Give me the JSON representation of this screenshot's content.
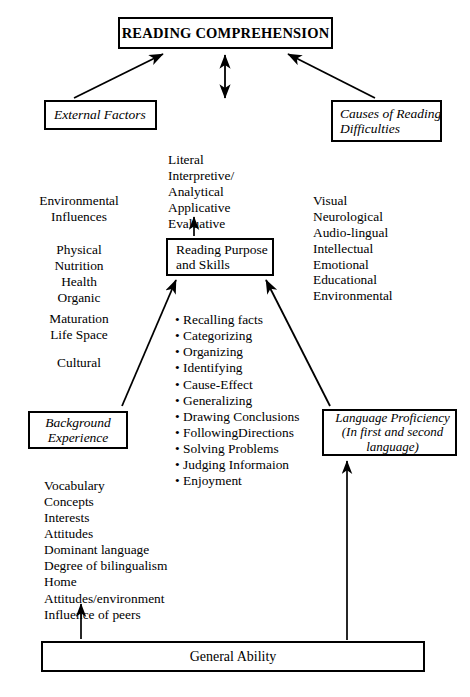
{
  "diagram": {
    "title_box": {
      "label": "READING COMPREHENSION"
    },
    "nodes": {
      "external_factors": {
        "label": "External Factors"
      },
      "causes_of_reading_difficulties": {
        "label": "Causes of Reading\nDifficulties"
      },
      "reading_purpose_and_skills": {
        "label": "Reading Purpose\nand Skills"
      },
      "background_experience": {
        "label": "Background\nExperience"
      },
      "language_proficiency": {
        "label": "Language Proficiency\n(In first and second\nlanguage)"
      },
      "general_ability": {
        "label": "General Ability"
      }
    },
    "lists": {
      "skills_taxonomy": {
        "items": [
          "Literal",
          "Interpretive/",
          "Analytical",
          "Applicative",
          "Evaluative"
        ],
        "text": "Literal\nInterpretive/\nAnalytical\nApplicative\nEvaluative"
      },
      "environmental_influences": {
        "items": [
          "Environmental",
          "Influences"
        ],
        "text": "Environmental\nInfluences"
      },
      "physical": {
        "items": [
          "Physical",
          "Nutrition",
          "Health",
          "Organic"
        ],
        "text": "Physical\nNutrition\nHealth\nOrganic"
      },
      "maturation": {
        "items": [
          "Maturation",
          "Life Space"
        ],
        "text": "Maturation\nLife Space"
      },
      "cultural": {
        "items": [
          "Cultural"
        ],
        "text": "Cultural"
      },
      "causes_factors": {
        "items": [
          "Visual",
          "Neurological",
          "Audio-lingual",
          "Intellectual",
          "Emotional",
          "Educational",
          "Environmental"
        ],
        "text": "Visual\nNeurological\nAudio-lingual\nIntellectual\nEmotional\nEducational\nEnvironmental"
      },
      "comprehension_skills": {
        "items": [
          "• Recalling facts",
          "• Categorizing",
          "• Organizing",
          "• Identifying",
          "• Cause-Effect",
          "• Generalizing",
          "• Drawing Conclusions",
          "• FollowingDirections",
          "• Solving Problems",
          "• Judging Informaion",
          "• Enjoyment"
        ],
        "text": "• Recalling facts\n• Categorizing\n• Organizing\n• Identifying\n• Cause-Effect\n• Generalizing\n• Drawing Conclusions\n• FollowingDirections\n• Solving Problems\n• Judging Informaion\n• Enjoyment"
      },
      "background_factors": {
        "items": [
          "Vocabulary",
          "Concepts",
          "Interests",
          "Attitudes",
          "Dominant language",
          "Degree of bilingualism",
          "Home",
          "Attitudes/environment",
          "Influence of peers"
        ],
        "text": "Vocabulary\nConcepts\nInterests\nAttitudes\nDominant language\nDegree of bilingualism\nHome\nAttitudes/environment\nInfluence of peers"
      }
    },
    "caption": {
      "text": ""
    }
  },
  "colors": {
    "ink": "#000000",
    "paper": "#ffffff"
  }
}
